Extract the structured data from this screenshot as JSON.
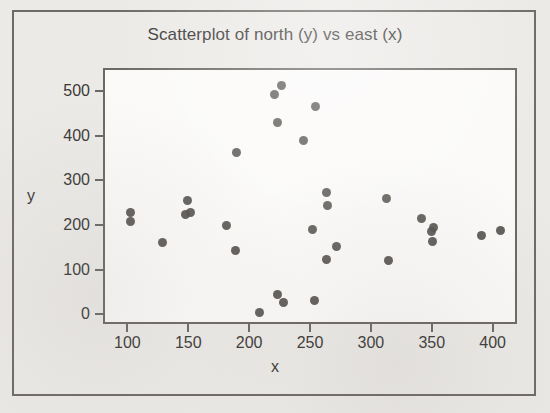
{
  "chart_data": {
    "type": "scatter",
    "title": "Scatterplot of north (y) vs east (x)",
    "xlabel": "x",
    "ylabel": "y",
    "xlim": [
      80,
      420
    ],
    "ylim": [
      -22,
      552
    ],
    "grid": false,
    "legend": null,
    "xticks": [
      100,
      150,
      200,
      250,
      300,
      350,
      400
    ],
    "yticks": [
      0,
      100,
      200,
      300,
      400,
      500
    ],
    "xtick_labels": [
      "100",
      "150",
      "200",
      "250",
      "300",
      "350",
      "400"
    ],
    "ytick_labels": [
      "0",
      "100",
      "200",
      "300",
      "400",
      "500"
    ],
    "marker": "filled-circle",
    "marker_color": "#565350",
    "points": [
      {
        "x": 101,
        "y": 233
      },
      {
        "x": 101,
        "y": 213
      },
      {
        "x": 127,
        "y": 166
      },
      {
        "x": 148,
        "y": 259
      },
      {
        "x": 146,
        "y": 229
      },
      {
        "x": 150,
        "y": 232
      },
      {
        "x": 180,
        "y": 204
      },
      {
        "x": 187,
        "y": 148
      },
      {
        "x": 188,
        "y": 368
      },
      {
        "x": 207,
        "y": 8
      },
      {
        "x": 219,
        "y": 497
      },
      {
        "x": 222,
        "y": 435
      },
      {
        "x": 225,
        "y": 518
      },
      {
        "x": 222,
        "y": 49
      },
      {
        "x": 227,
        "y": 31
      },
      {
        "x": 243,
        "y": 394
      },
      {
        "x": 250,
        "y": 194
      },
      {
        "x": 252,
        "y": 36
      },
      {
        "x": 253,
        "y": 471
      },
      {
        "x": 262,
        "y": 277
      },
      {
        "x": 263,
        "y": 248
      },
      {
        "x": 262,
        "y": 128
      },
      {
        "x": 270,
        "y": 157
      },
      {
        "x": 311,
        "y": 264
      },
      {
        "x": 313,
        "y": 124
      },
      {
        "x": 340,
        "y": 220
      },
      {
        "x": 348,
        "y": 190
      },
      {
        "x": 350,
        "y": 199
      },
      {
        "x": 349,
        "y": 167
      },
      {
        "x": 389,
        "y": 182
      },
      {
        "x": 405,
        "y": 192
      }
    ]
  }
}
